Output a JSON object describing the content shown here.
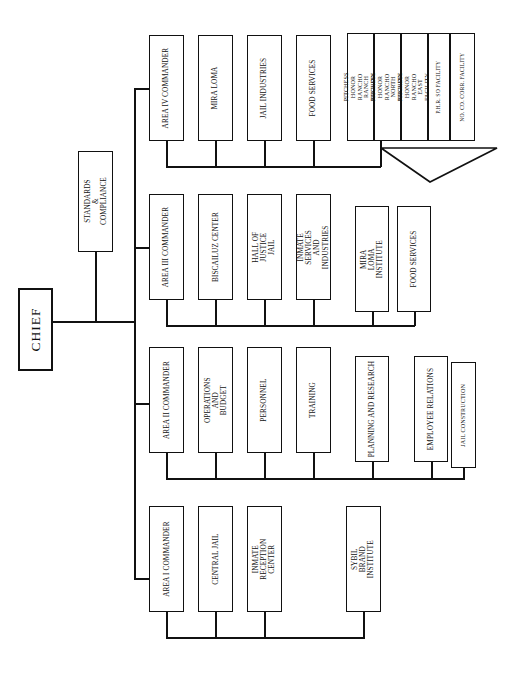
{
  "chart": {
    "orientation": "rotated-90",
    "root": {
      "label": "CHIEF"
    },
    "staff": {
      "label": "STANDARDS & COMPLIANCE"
    },
    "areas": [
      {
        "id": "area-4",
        "commander": "AREA IV COMMANDER",
        "units": [
          "MIRA LOMA",
          "JAIL INDUSTRIES",
          "FOOD SERVICES"
        ],
        "group": {
          "name": "pitchess-group",
          "units": [
            "PITCHESS HONOR RANCHO RANCH FACILITY",
            "PITCHESS HONOR RANCHO NORTH FACILITY",
            "PITCHESS HONOR RANCHO EAST FACILITY",
            "P.H.R. SO FACILITY",
            "NO. CO. CORR. FACILITY"
          ]
        }
      },
      {
        "id": "area-3",
        "commander": "AREA III COMMANDER",
        "units": [
          "BISCAILUZ CENTER",
          "HALL OF JUSTICE JAIL",
          "INMATE SERVICES AND INDUSTRIES",
          "MIRA LOMA INSTITUTE",
          "FOOD SERVICES"
        ]
      },
      {
        "id": "area-2",
        "commander": "AREA II COMMANDER",
        "units": [
          "OPERATIONS AND BUDGET",
          "PERSONNEL",
          "TRAINING",
          "PLANNING AND RESEARCH",
          "EMPLOYEE RELATIONS",
          "JAIL CONSTRUCTION"
        ]
      },
      {
        "id": "area-1",
        "commander": "AREA I COMMANDER",
        "units": [
          "CENTRAL JAIL",
          "INMATE RECEPTION CENTER",
          "SYBIL BRAND INSTITUTE"
        ]
      }
    ],
    "colors": {
      "line": "#111111",
      "box_fill": "#ffffff",
      "text": "#111111"
    }
  }
}
